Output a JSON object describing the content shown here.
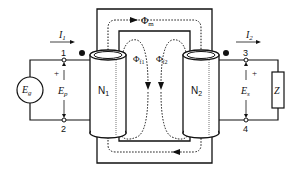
{
  "diagram": {
    "type": "transformer-schematic",
    "labels": {
      "i1": "I",
      "i1_sub": "1",
      "i2": "I",
      "i2_sub": "2",
      "terminal_1": "1",
      "terminal_2": "2",
      "terminal_3": "3",
      "terminal_4": "4",
      "eg": "E",
      "eg_sub": "g",
      "ep": "E",
      "ep_sub": "p",
      "es": "E",
      "es_sub": "s",
      "ep_plus": "+",
      "es_plus": "+",
      "z": "Z",
      "n1": "N",
      "n1_sub": "1",
      "n2": "N",
      "n2_sub": "2",
      "phi_m": "Φ",
      "phi_m_sub": "m",
      "phi_f1": "Φ",
      "phi_f1_sub": "f1",
      "phi_f2": "Φ",
      "phi_f2_sub": "f2"
    },
    "colors": {
      "line": "#111111",
      "background": "#ffffff",
      "coil_shading": "#bbbbbb"
    }
  }
}
